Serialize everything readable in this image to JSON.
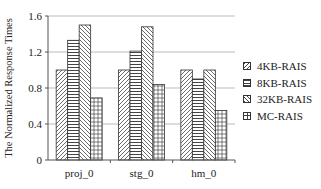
{
  "chart_data": {
    "type": "bar",
    "title": "",
    "xlabel": "",
    "ylabel": "The Normalized Response Times",
    "ylim": [
      0,
      1.6
    ],
    "yticks": [
      0,
      0.4,
      0.8,
      1.2,
      1.6
    ],
    "ytick_labels": [
      "0",
      "0.4",
      "0.8",
      "1.2",
      "1.6"
    ],
    "grid": true,
    "legend_position": "right",
    "categories": [
      "proj_0",
      "stg_0",
      "hm_0"
    ],
    "series": [
      {
        "name": "4KB-RAIS",
        "pattern": "diagonal-forward",
        "values": [
          1.0,
          1.0,
          1.0
        ]
      },
      {
        "name": "8KB-RAIS",
        "pattern": "horizontal",
        "values": [
          1.33,
          1.21,
          0.9
        ]
      },
      {
        "name": "32KB-RAIS",
        "pattern": "diagonal-back",
        "values": [
          1.5,
          1.48,
          1.0
        ]
      },
      {
        "name": "MC-RAIS",
        "pattern": "grid",
        "values": [
          0.69,
          0.84,
          0.55
        ]
      }
    ]
  },
  "legend": {
    "items": [
      {
        "label": "4KB-RAIS"
      },
      {
        "label": "8KB-RAIS"
      },
      {
        "label": "32KB-RAIS"
      },
      {
        "label": "MC-RAIS"
      }
    ]
  }
}
